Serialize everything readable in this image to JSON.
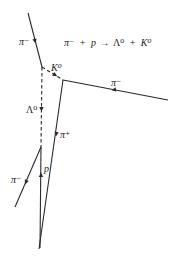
{
  "diagram": {
    "equation": {
      "text": "π⁻ + p → Λ⁰ + K⁰",
      "parts": {
        "pi_minus": "π⁻",
        "plus1": "+",
        "p": "p",
        "arrow": "→",
        "lambda0": "Λ⁰",
        "plus2": "+",
        "k0": "K⁰"
      }
    },
    "colors": {
      "track": "#2a2a2a",
      "text": "#222222",
      "background": "#ffffff"
    },
    "vertices": [
      {
        "id": "V1",
        "label": "production vertex",
        "x": 42,
        "y": 67
      },
      {
        "id": "V2",
        "label": "K0 decay vertex",
        "x": 63,
        "y": 80
      },
      {
        "id": "V3",
        "label": "Lambda0 decay vertex",
        "x": 41,
        "y": 147
      }
    ],
    "tracks": [
      {
        "id": "incoming-pi-minus",
        "label": "π⁻",
        "style": "solid",
        "from": [
          28,
          13
        ],
        "to": [
          42,
          67
        ],
        "arrow": [
          35,
          40
        ]
      },
      {
        "id": "k0",
        "label": "K⁰",
        "style": "dashed",
        "from": [
          42,
          67
        ],
        "to": [
          63,
          80
        ],
        "arrow": [
          55,
          75
        ]
      },
      {
        "id": "outgoing-pi-minus",
        "label": "π⁻",
        "style": "solid",
        "from": [
          63,
          80
        ],
        "to": [
          168,
          100
        ],
        "arrow": [
          114,
          89.7
        ]
      },
      {
        "id": "pi-plus",
        "label": "π⁺",
        "style": "solid",
        "from": [
          63,
          80
        ],
        "to": [
          39,
          249
        ],
        "arrow": [
          56,
          134
        ]
      },
      {
        "id": "lambda0",
        "label": "Λ⁰",
        "style": "dashed",
        "from": [
          42,
          67
        ],
        "to": [
          41,
          147
        ],
        "arrow": [
          41.5,
          109
        ]
      },
      {
        "id": "lower-pi-minus",
        "label": "π⁻",
        "style": "solid",
        "from": [
          41,
          147
        ],
        "to": [
          15,
          207
        ],
        "arrow": [
          26,
          182
        ]
      },
      {
        "id": "proton",
        "label": "p",
        "style": "solid",
        "from": [
          41,
          147
        ],
        "to": [
          40,
          248
        ],
        "arrow": [
          41,
          175
        ]
      }
    ],
    "labels": {
      "incoming_pi_minus": "π⁻",
      "k0": "K⁰",
      "outgoing_pi_minus": "π⁻",
      "lambda0": "Λ⁰",
      "pi_plus": "π⁺",
      "proton": "p",
      "lower_pi_minus": "π⁻"
    }
  }
}
